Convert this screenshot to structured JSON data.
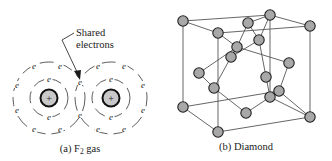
{
  "figure_a": {
    "caption_prefix": "(a) F",
    "caption_sub": "2",
    "caption_suffix": " gas",
    "annotation_line1": "Shared",
    "annotation_line2": "electrons",
    "electron_symbol": "e",
    "nucleus_symbol": "+",
    "atoms": [
      {
        "cx": 49,
        "cy": 98,
        "nucleus_r": 8.5,
        "inner_r": 19,
        "outer_r": 36
      },
      {
        "cx": 111,
        "cy": 98,
        "nucleus_r": 8.5,
        "inner_r": 19,
        "outer_r": 36
      }
    ],
    "electrons": [
      {
        "x": 49,
        "y": 80
      },
      {
        "x": 49,
        "y": 118
      },
      {
        "x": 111,
        "y": 80
      },
      {
        "x": 111,
        "y": 118
      },
      {
        "x": 34,
        "y": 67
      },
      {
        "x": 60,
        "y": 67
      },
      {
        "x": 17,
        "y": 86
      },
      {
        "x": 17,
        "y": 111
      },
      {
        "x": 34,
        "y": 130
      },
      {
        "x": 60,
        "y": 130
      },
      {
        "x": 98,
        "y": 67
      },
      {
        "x": 124,
        "y": 67
      },
      {
        "x": 143,
        "y": 86
      },
      {
        "x": 143,
        "y": 111
      },
      {
        "x": 98,
        "y": 130
      },
      {
        "x": 124,
        "y": 130
      },
      {
        "x": 80,
        "y": 83
      },
      {
        "x": 80,
        "y": 116
      }
    ]
  },
  "figure_b": {
    "caption": "(b) Diamond",
    "atom_color": "#a8a8a8",
    "atoms": [
      {
        "id": "A",
        "x": 183,
        "y": 21
      },
      {
        "id": "B",
        "x": 270,
        "y": 15
      },
      {
        "id": "C",
        "x": 310,
        "y": 26
      },
      {
        "id": "D",
        "x": 218,
        "y": 33
      },
      {
        "id": "E",
        "x": 248,
        "y": 23
      },
      {
        "id": "F",
        "x": 259,
        "y": 40
      },
      {
        "id": "G",
        "x": 237,
        "y": 47
      },
      {
        "id": "H",
        "x": 231,
        "y": 57
      },
      {
        "id": "I",
        "x": 289,
        "y": 63
      },
      {
        "id": "J",
        "x": 199,
        "y": 73
      },
      {
        "id": "K",
        "x": 266,
        "y": 77
      },
      {
        "id": "L",
        "x": 214,
        "y": 88
      },
      {
        "id": "M",
        "x": 279,
        "y": 91
      },
      {
        "id": "N",
        "x": 270,
        "y": 97
      },
      {
        "id": "O",
        "x": 183,
        "y": 107
      },
      {
        "id": "P",
        "x": 246,
        "y": 113
      },
      {
        "id": "Q",
        "x": 310,
        "y": 117
      },
      {
        "id": "R",
        "x": 218,
        "y": 132
      }
    ],
    "bonds": [
      [
        "A",
        "B"
      ],
      [
        "A",
        "D"
      ],
      [
        "D",
        "C"
      ],
      [
        "B",
        "C"
      ],
      [
        "A",
        "O"
      ],
      [
        "D",
        "R"
      ],
      [
        "B",
        "N"
      ],
      [
        "C",
        "Q"
      ],
      [
        "O",
        "R"
      ],
      [
        "R",
        "Q"
      ],
      [
        "O",
        "M"
      ],
      [
        "D",
        "G"
      ],
      [
        "E",
        "G"
      ],
      [
        "E",
        "B"
      ],
      [
        "E",
        "F"
      ],
      [
        "F",
        "B"
      ],
      [
        "F",
        "H"
      ],
      [
        "G",
        "H"
      ],
      [
        "G",
        "I"
      ],
      [
        "H",
        "L"
      ],
      [
        "J",
        "L"
      ],
      [
        "J",
        "G"
      ],
      [
        "L",
        "P"
      ],
      [
        "P",
        "N"
      ],
      [
        "I",
        "M"
      ],
      [
        "K",
        "N"
      ],
      [
        "K",
        "F"
      ],
      [
        "M",
        "N"
      ],
      [
        "M",
        "Q"
      ],
      [
        "N",
        "Q"
      ]
    ]
  }
}
